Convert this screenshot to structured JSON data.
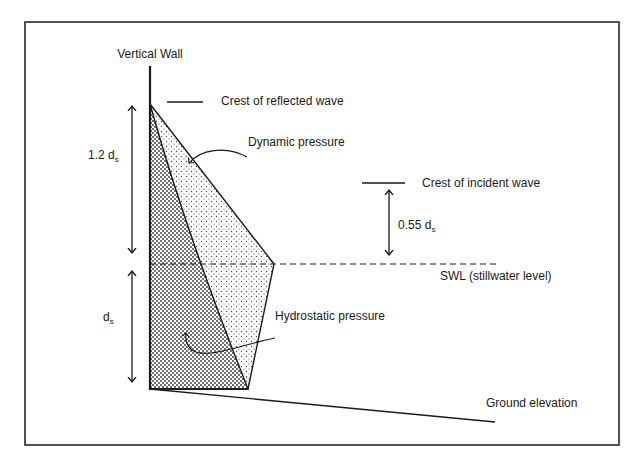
{
  "diagram": {
    "title_label": "Vertical Wall",
    "labels": {
      "crest_reflected": "Crest of reflected wave",
      "dynamic_pressure": "Dynamic pressure",
      "crest_incident": "Crest of incident wave",
      "swl": "SWL (stillwater level)",
      "hydrostatic_pressure": "Hydrostatic pressure",
      "ground_elevation": "Ground elevation"
    },
    "dimensions": {
      "upper": {
        "coef": "1.2 d",
        "sub": "s"
      },
      "lower": {
        "coef": "d",
        "sub": "s"
      },
      "incident": {
        "coef": "0.55 d",
        "sub": "s"
      }
    },
    "colors": {
      "line": "#1a1a1a",
      "background": "#ffffff",
      "dense_stipple": "#2a2a2a",
      "light_stipple": "#4a4a4a"
    }
  }
}
